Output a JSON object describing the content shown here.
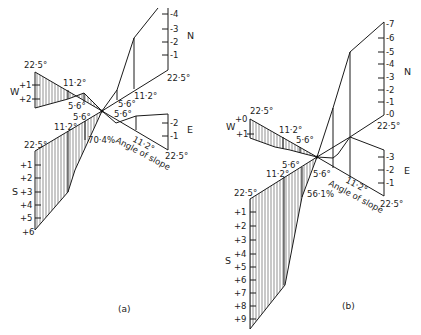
{
  "figure": {
    "panels": [
      {
        "id": "a",
        "caption": "(a)",
        "percent_label": "70·4%",
        "slope_label": "Angle of slope",
        "angle_labels": {
          "w_top": "22·5°",
          "w_mid": "11·2°",
          "w_inner": "5·6°",
          "s_inner": "5·6°",
          "s_mid": "11·2°",
          "s_top": "22·5°",
          "n_outer": "22·5°",
          "n_mid": "11·2°",
          "n_inner": "5·6°",
          "e_inner": "5·6°",
          "e_mid": "11·2°",
          "e_outer": "22·5°"
        },
        "axes": {
          "N": {
            "label": "N",
            "ticks": [
              "-4",
              "-3",
              "-2",
              "-1"
            ]
          },
          "W": {
            "label": "W",
            "ticks": [
              "+1",
              "+2"
            ]
          },
          "E": {
            "label": "E",
            "ticks": [
              "-2",
              "-1"
            ]
          },
          "S": {
            "label": "S",
            "ticks": [
              "+1",
              "+2",
              "+3",
              "+4",
              "+5",
              "+6"
            ]
          }
        }
      },
      {
        "id": "b",
        "caption": "(b)",
        "percent_label": "56·1%",
        "slope_label": "Angle of slope",
        "angle_labels": {
          "w_top": "22·5°",
          "w_mid": "11·2°",
          "w_inner": "5·6°",
          "s_inner": "5·6°",
          "s_mid": "11·2°",
          "s_top": "22·5°",
          "n_outer": "22·5°",
          "e_inner": "5·6°",
          "e_mid": "11·2°",
          "e_outer": "22·5°"
        },
        "axes": {
          "N": {
            "label": "N",
            "ticks": [
              "-7",
              "-6",
              "-5",
              "-4",
              "-3",
              "-2",
              "-1",
              "-0"
            ]
          },
          "W": {
            "label": "W",
            "ticks": [
              "+0",
              "+1"
            ]
          },
          "E": {
            "label": "E",
            "ticks": [
              "-3",
              "-2",
              "-1"
            ]
          },
          "S": {
            "label": "S",
            "ticks": [
              "+1",
              "+2",
              "+3",
              "+4",
              "+5",
              "+6",
              "+7",
              "+8",
              "+9"
            ]
          }
        }
      }
    ]
  }
}
